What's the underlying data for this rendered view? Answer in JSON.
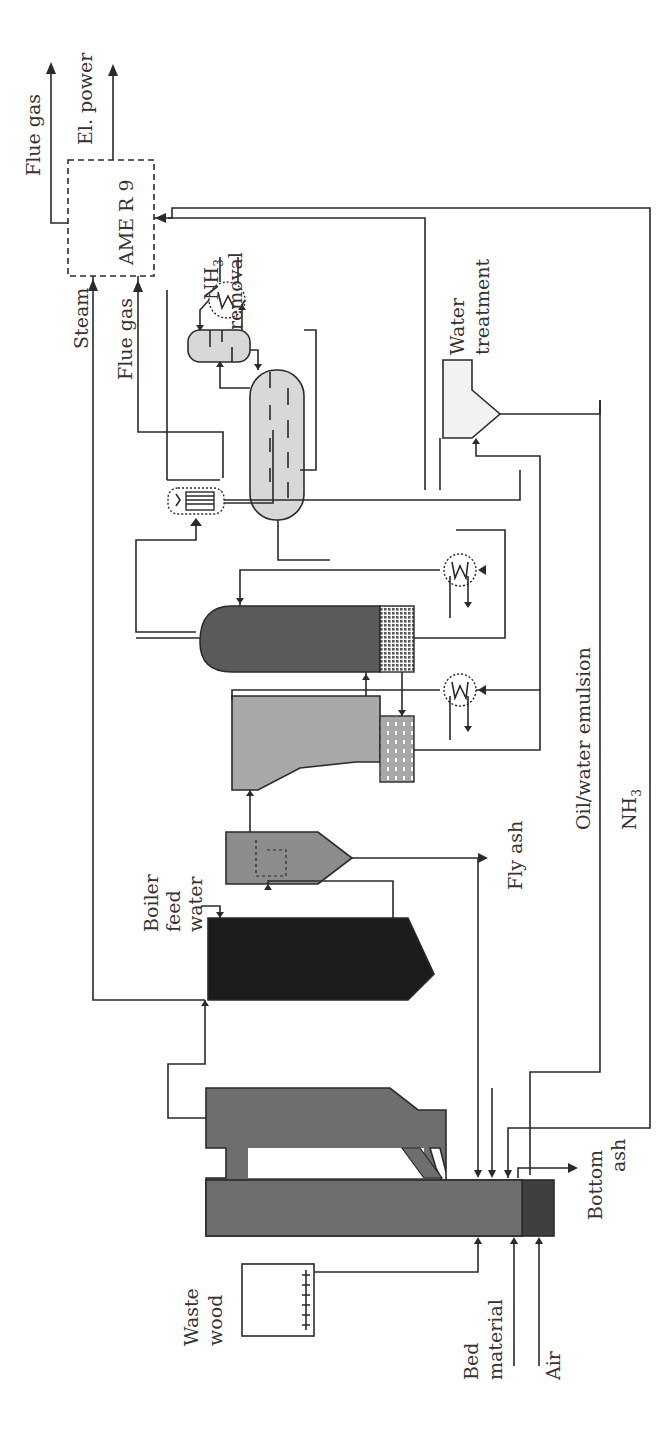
{
  "diagram": {
    "colors": {
      "gasifier": "#6e6e6e",
      "bed_zone": "#3f3f3f",
      "boiler": "#1c1c1c",
      "cyclone": "#8c8c8c",
      "scrubber": "#a8a8a8",
      "rme_column": "#5a5a5a",
      "nh3_vessel": "#d8d8d8",
      "water_treatment": "#f2f2f2",
      "line": "#2a2a2a",
      "text": "#333333"
    },
    "labels": {
      "flue_gas_top": "Flue gas",
      "el_power": "El. power",
      "engine": "AME R 9",
      "steam": "Steam",
      "flue_gas_in": "Flue gas",
      "nh3_removal_line1": "NH",
      "nh3_removal_sub": "3",
      "nh3_removal_line2": "removal",
      "water_treatment_line1": "Water",
      "water_treatment_line2": "treatment",
      "boiler_feed_line1": "Boiler",
      "boiler_feed_line2": "feed",
      "boiler_feed_line3": "water",
      "fly_ash": "Fly ash",
      "oil_water": "Oil/water emulsion",
      "nh3_line": "NH",
      "nh3_line_sub": "3",
      "waste_wood_line1": "Waste",
      "waste_wood_line2": "wood",
      "bed_material_line1": "Bed",
      "bed_material_line2": "material",
      "air": "Air",
      "bottom_ash_line1": "Bottom",
      "bottom_ash_line2": "ash"
    },
    "units": [
      {
        "id": "waste-wood-hopper",
        "label": "Waste wood"
      },
      {
        "id": "gasifier",
        "label": "Gasifier"
      },
      {
        "id": "boiler",
        "label": "Boiler"
      },
      {
        "id": "cyclone",
        "label": "Fly ash separator"
      },
      {
        "id": "scrubber",
        "label": "Scrubber"
      },
      {
        "id": "column",
        "label": "Scrubber column"
      },
      {
        "id": "cooler-1",
        "label": "Cooler"
      },
      {
        "id": "cooler-2",
        "label": "Cooler"
      },
      {
        "id": "heat-exchanger",
        "label": "Heat exchanger"
      },
      {
        "id": "nh3-removal",
        "label": "NH3 removal"
      },
      {
        "id": "water-treatment",
        "label": "Water treatment"
      },
      {
        "id": "engine",
        "label": "AME R 9"
      }
    ]
  }
}
